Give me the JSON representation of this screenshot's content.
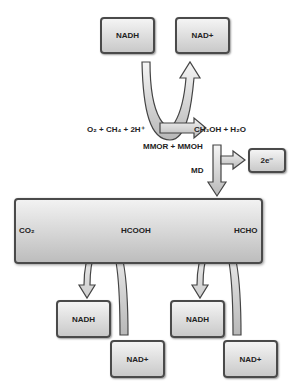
{
  "top": {
    "nadh": "NADH",
    "nad_plus": "NAD+"
  },
  "reaction": {
    "reactants": "O₂ + CH₄ + 2H⁺",
    "products": "CH₃OH + H₂O",
    "enzyme": "MMOR + MMOH"
  },
  "md": {
    "label": "MD",
    "electrons": "2e⁻"
  },
  "pathway": {
    "co2": "CO₂",
    "hcooh": "HCOOH",
    "hcho": "HCHO"
  },
  "bottom_left": {
    "nadh": "NADH",
    "nad_plus": "NAD+"
  },
  "bottom_right": {
    "nadh": "NADH",
    "nad_plus": "NAD+"
  }
}
